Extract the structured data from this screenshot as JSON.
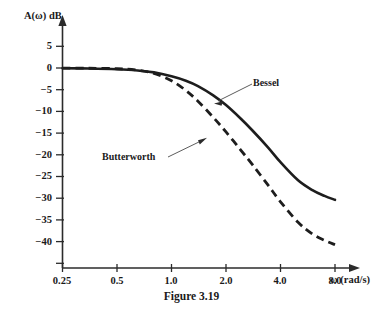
{
  "figure": {
    "caption": "Figure 3.19",
    "background_color": "#ffffff",
    "ink_color": "#1d1d1d"
  },
  "chart_data": {
    "type": "line",
    "title": "",
    "subtitle": "",
    "xlabel": "ω (rad/s)",
    "ylabel": "A(ω) dB",
    "xscale": "log",
    "xlim": [
      0.25,
      8.0
    ],
    "ylim": [
      -40,
      7
    ],
    "grid": false,
    "legend_position": "inline-annotations",
    "xticks": [
      0.25,
      0.5,
      1.0,
      2.0,
      4.0,
      8.0
    ],
    "xticklabels": [
      "0.25",
      "0.5",
      "1.0",
      "2.0",
      "4.0",
      "8.0"
    ],
    "yticks": [
      5,
      0,
      -5,
      -10,
      -15,
      -20,
      -25,
      -30,
      -35,
      -40
    ],
    "yticklabels": [
      "5",
      "0",
      "−5",
      "−10",
      "−15",
      "−20",
      "−25",
      "−30",
      "−35",
      "−40"
    ],
    "annotations": [
      {
        "text": "Bessel",
        "target_series": "Bessel",
        "label_x": 2.55,
        "label_y": -4.2,
        "points_to_x": 1.95,
        "points_to_y": -7.6
      },
      {
        "text": "Butterworth",
        "target_series": "Butterworth",
        "label_x": 0.75,
        "label_y": -19.0,
        "points_to_x": 2.45,
        "points_to_y": -15.6
      }
    ],
    "series": [
      {
        "name": "Bessel",
        "style": "solid",
        "color": "#1d1d1d",
        "x": [
          0.25,
          0.35,
          0.5,
          0.65,
          0.8,
          1.0,
          1.2,
          1.4,
          1.7,
          2.0,
          2.4,
          2.8,
          3.4,
          4.0,
          5.0,
          6.0,
          7.0,
          8.0
        ],
        "y": [
          -0.05,
          -0.1,
          -0.25,
          -0.5,
          -0.9,
          -1.7,
          -2.6,
          -3.7,
          -5.6,
          -7.6,
          -10.3,
          -12.8,
          -16.2,
          -19.3,
          -23.0,
          -25.0,
          -26.2,
          -27.0
        ]
      },
      {
        "name": "Butterworth",
        "style": "dashed",
        "color": "#1d1d1d",
        "x": [
          0.25,
          0.35,
          0.5,
          0.65,
          0.8,
          1.0,
          1.2,
          1.4,
          1.7,
          2.0,
          2.4,
          2.8,
          3.4,
          4.0,
          5.0,
          6.0,
          7.0,
          8.0
        ],
        "y": [
          -0.02,
          -0.05,
          -0.15,
          -0.45,
          -1.1,
          -2.6,
          -4.6,
          -6.8,
          -10.1,
          -13.1,
          -16.7,
          -19.8,
          -23.9,
          -27.4,
          -31.6,
          -34.0,
          -35.3,
          -36.2
        ]
      }
    ]
  }
}
